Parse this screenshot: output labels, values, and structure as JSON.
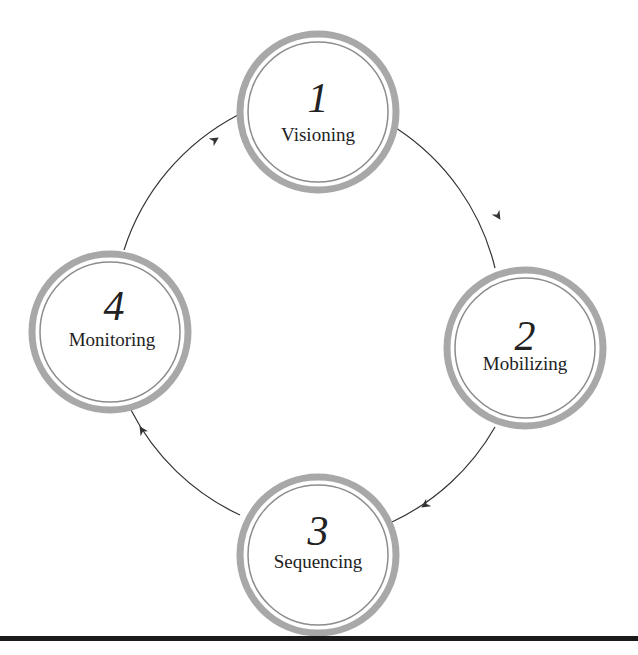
{
  "diagram": {
    "type": "cycle",
    "nodes": [
      {
        "number": "1",
        "label": "Visioning"
      },
      {
        "number": "2",
        "label": "Mobilizing"
      },
      {
        "number": "3",
        "label": "Sequencing"
      },
      {
        "number": "4",
        "label": "Monitoring"
      }
    ],
    "edges": [
      {
        "from": "1",
        "to": "2"
      },
      {
        "from": "2",
        "to": "3"
      },
      {
        "from": "3",
        "to": "4"
      },
      {
        "from": "4",
        "to": "1"
      }
    ],
    "colors": {
      "ring": "#a8a8a8",
      "arrow": "#333333",
      "text": "#222222",
      "rule": "#1a1a1a"
    }
  }
}
